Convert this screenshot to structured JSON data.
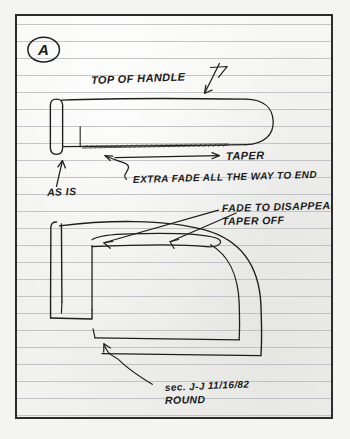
{
  "document": {
    "medium": "hand-drawn pencil sketch on ruled notebook paper",
    "sheet_label": "A",
    "date": "11/16/82"
  },
  "annotations": {
    "sheet_marker": "A",
    "top_of_handle": "TOP OF HANDLE",
    "taper": "TAPER",
    "as_is": "AS IS",
    "extra_fade": "EXTRA FADE ALL THE WAY TO END",
    "fade_to_disappear": "FADE TO DISAPPEAR",
    "taper_off": "TAPER OFF",
    "section_label": "sec. J-J",
    "section_date": "11/16/82",
    "section_shape": "ROUND"
  },
  "figures": {
    "top_view": {
      "name": "handle side profile with taper",
      "caption_refs": [
        "TOP OF HANDLE",
        "TAPER",
        "AS IS",
        "EXTRA FADE ALL THE WAY TO END"
      ]
    },
    "bottom_view": {
      "name": "handle section view, rounded end",
      "caption_refs": [
        "FADE TO DISAPPEAR",
        "TAPER OFF",
        "sec. J-J",
        "ROUND"
      ]
    }
  },
  "colors": {
    "paper": "#f1f1ef",
    "rule_line": "#b9bcc0",
    "ink": "#1a1a1a",
    "frame": "#2c2c2c"
  }
}
